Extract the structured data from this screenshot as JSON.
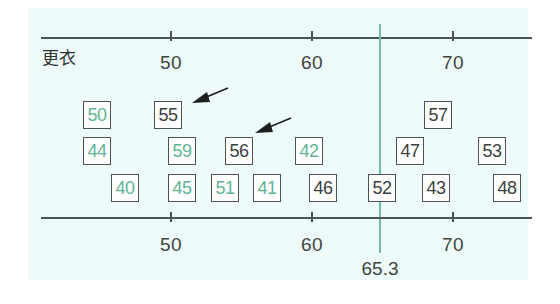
{
  "diagram": {
    "title": "更衣",
    "axis": {
      "ticks": [
        {
          "value": 50,
          "label": "50",
          "x": 170
        },
        {
          "value": 60,
          "label": "60",
          "x": 311
        },
        {
          "value": 70,
          "label": "70",
          "x": 452
        }
      ]
    },
    "mean_line": {
      "value": 65.3,
      "label": "65.3",
      "color": "#6cbfa4"
    },
    "colors": {
      "green": "#5fb596",
      "dark": "#3b413f",
      "background": "#effafa"
    },
    "boxes": [
      {
        "value": "50",
        "color": "green",
        "row": 1,
        "x": 83
      },
      {
        "value": "55",
        "color": "dark",
        "row": 1,
        "x": 154,
        "arrow": true
      },
      {
        "value": "57",
        "color": "dark",
        "row": 1,
        "x": 424
      },
      {
        "value": "44",
        "color": "green",
        "row": 2,
        "x": 83
      },
      {
        "value": "59",
        "color": "green",
        "row": 2,
        "x": 168
      },
      {
        "value": "56",
        "color": "dark",
        "row": 2,
        "x": 225,
        "arrow": true
      },
      {
        "value": "42",
        "color": "green",
        "row": 2,
        "x": 295
      },
      {
        "value": "47",
        "color": "dark",
        "row": 2,
        "x": 396
      },
      {
        "value": "53",
        "color": "dark",
        "row": 2,
        "x": 478
      },
      {
        "value": "40",
        "color": "green",
        "row": 3,
        "x": 111
      },
      {
        "value": "45",
        "color": "green",
        "row": 3,
        "x": 168
      },
      {
        "value": "51",
        "color": "green",
        "row": 3,
        "x": 211
      },
      {
        "value": "41",
        "color": "green",
        "row": 3,
        "x": 253
      },
      {
        "value": "46",
        "color": "dark",
        "row": 3,
        "x": 309
      },
      {
        "value": "52",
        "color": "dark",
        "row": 3,
        "x": 368
      },
      {
        "value": "43",
        "color": "dark",
        "row": 3,
        "x": 422
      },
      {
        "value": "48",
        "color": "dark",
        "row": 3,
        "x": 493
      }
    ]
  }
}
